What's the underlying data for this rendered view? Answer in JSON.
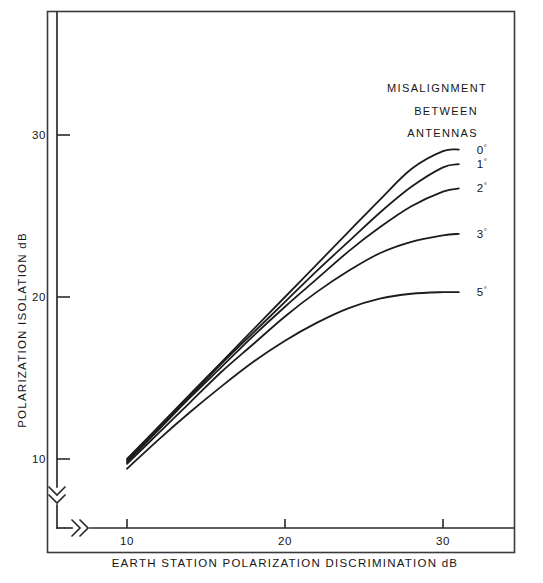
{
  "chart_data": {
    "type": "line",
    "title": "",
    "xlabel": "EARTH STATION POLARIZATION DISCRIMINATION dB",
    "ylabel": "POLARIZATION ISOLATION dB",
    "xlim": [
      8.9,
      31.2
    ],
    "ylim": [
      9.2,
      32.6
    ],
    "xticks": [
      "10",
      "20",
      "30"
    ],
    "yticks": [
      "10",
      "20",
      "30"
    ],
    "xtick_values": [
      10,
      20,
      30
    ],
    "ytick_values": [
      10,
      20,
      30
    ],
    "grid": false,
    "axis_break_x": true,
    "axis_break_y": true,
    "legend_position": "top-right, inline end-of-curve labels",
    "legend_title": [
      "MISALIGNMENT",
      "BETWEEN",
      "ANTENNAS"
    ],
    "x": [
      10,
      12,
      14,
      16,
      18,
      20,
      22,
      24,
      26,
      28,
      30,
      31
    ],
    "series": [
      {
        "name": "0",
        "label": "0",
        "unit": "°",
        "values": [
          10.0,
          12.0,
          14.0,
          16.0,
          18.0,
          20.0,
          22.0,
          24.0,
          26.0,
          27.9,
          29.0,
          29.1
        ]
      },
      {
        "name": "1",
        "label": "1",
        "unit": "°",
        "values": [
          9.9,
          11.9,
          13.9,
          15.9,
          17.8,
          19.7,
          21.6,
          23.4,
          25.2,
          26.8,
          28.0,
          28.2
        ]
      },
      {
        "name": "2",
        "label": "2",
        "unit": "°",
        "values": [
          9.8,
          11.8,
          13.8,
          15.7,
          17.6,
          19.4,
          21.1,
          22.8,
          24.3,
          25.6,
          26.5,
          26.7
        ]
      },
      {
        "name": "3",
        "label": "3",
        "unit": "°",
        "values": [
          9.7,
          11.6,
          13.5,
          15.4,
          17.1,
          18.8,
          20.3,
          21.6,
          22.7,
          23.4,
          23.8,
          23.9
        ]
      },
      {
        "name": "5",
        "label": "5",
        "unit": "°",
        "values": [
          9.4,
          11.2,
          12.9,
          14.5,
          16.0,
          17.3,
          18.4,
          19.3,
          19.9,
          20.2,
          20.3,
          20.3
        ]
      }
    ]
  },
  "colors": {
    "background": "#ffffff",
    "curve": "#1c1c1c",
    "axis": "#2b2b2b",
    "frame": "#3a3a3a",
    "text": "#151515"
  }
}
